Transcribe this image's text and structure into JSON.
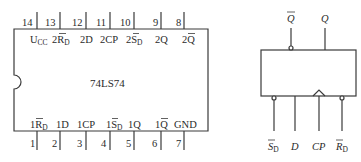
{
  "chip": {
    "name": "74LS74",
    "top_pins": [
      {
        "num": "14",
        "label": "U",
        "sub": "CC",
        "bar": false,
        "prefix": ""
      },
      {
        "num": "13",
        "label": "R",
        "sub": "D",
        "bar": true,
        "prefix": "2"
      },
      {
        "num": "12",
        "label": "2D",
        "sub": "",
        "bar": false,
        "prefix": ""
      },
      {
        "num": "11",
        "label": "2CP",
        "sub": "",
        "bar": false,
        "prefix": ""
      },
      {
        "num": "10",
        "label": "S",
        "sub": "D",
        "bar": true,
        "prefix": "2"
      },
      {
        "num": "9",
        "label": "2Q",
        "sub": "",
        "bar": false,
        "prefix": ""
      },
      {
        "num": "8",
        "label": "Q",
        "sub": "",
        "bar": true,
        "prefix": "2"
      }
    ],
    "bottom_pins": [
      {
        "num": "1",
        "label": "R",
        "sub": "D",
        "bar": true,
        "prefix": "1"
      },
      {
        "num": "2",
        "label": "1D",
        "sub": "",
        "bar": false,
        "prefix": ""
      },
      {
        "num": "3",
        "label": "1CP",
        "sub": "",
        "bar": false,
        "prefix": ""
      },
      {
        "num": "4",
        "label": "S",
        "sub": "D",
        "bar": true,
        "prefix": "1"
      },
      {
        "num": "5",
        "label": "1Q",
        "sub": "",
        "bar": false,
        "prefix": ""
      },
      {
        "num": "6",
        "label": "Q",
        "sub": "",
        "bar": true,
        "prefix": "1"
      },
      {
        "num": "7",
        "label": "GND",
        "sub": "",
        "bar": false,
        "prefix": ""
      }
    ]
  },
  "symbol": {
    "outputs": [
      {
        "label": "Q",
        "bar": true,
        "inverted": true
      },
      {
        "label": "Q",
        "bar": false,
        "inverted": false
      }
    ],
    "inputs": [
      {
        "label": "S",
        "sub": "D",
        "bar": true,
        "inverted": true
      },
      {
        "label": "D",
        "sub": "",
        "bar": false,
        "inverted": false
      },
      {
        "label": "CP",
        "sub": "",
        "bar": false,
        "clock": true
      },
      {
        "label": "R",
        "sub": "D",
        "bar": true,
        "inverted": true
      }
    ]
  },
  "colors": {
    "line": "#3a3a3a",
    "text": "#2a2a2a"
  }
}
